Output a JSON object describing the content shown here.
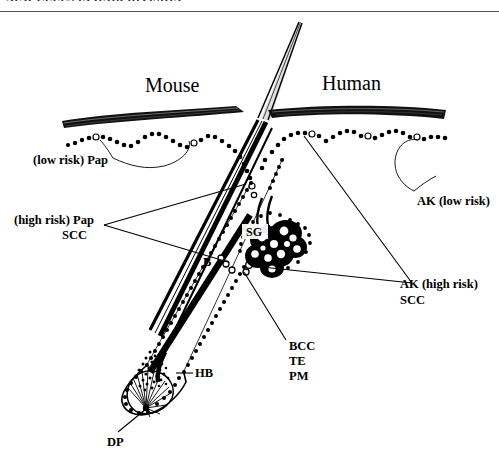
{
  "page": {
    "running_head": "NEW CELLS IN HAIR DIVISION",
    "width": 499,
    "height": 457,
    "background": "#ffffff",
    "ink": "#000000"
  },
  "figure": {
    "type": "anatomical-diagram",
    "panel_titles": {
      "left": "Mouse",
      "right": "Human"
    },
    "labels": {
      "low_risk_pap": "(low risk) Pap",
      "high_risk_pap": "(high risk) Pap",
      "high_risk_scc": "SCC",
      "ak_low_risk": "AK (low risk)",
      "ak_high_risk": "AK (high risk)",
      "ak_scc": "SCC",
      "bcc": "BCC",
      "te": "TE",
      "pm": "PM",
      "hb": "HB",
      "dp": "DP",
      "sg": "SG",
      "b": "B"
    },
    "structures": [
      {
        "key": "sg",
        "abbr": "SG",
        "name": "sebaceous gland"
      },
      {
        "key": "b",
        "abbr": "B",
        "name": "bulge"
      },
      {
        "key": "hb",
        "abbr": "HB",
        "name": "hair bulb"
      },
      {
        "key": "dp",
        "abbr": "DP",
        "name": "dermal papilla"
      }
    ],
    "tumor_types": [
      {
        "abbr": "Pap",
        "name": "papilloma"
      },
      {
        "abbr": "SCC",
        "name": "squamous cell carcinoma"
      },
      {
        "abbr": "AK",
        "name": "actinic keratosis"
      },
      {
        "abbr": "BCC",
        "name": "basal cell carcinoma"
      },
      {
        "abbr": "TE",
        "name": "trichoepithelioma"
      },
      {
        "abbr": "PM",
        "name": "pilomatricoma"
      }
    ]
  }
}
